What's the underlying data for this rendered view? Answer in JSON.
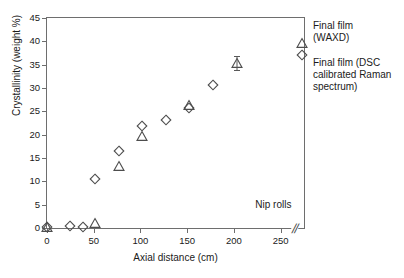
{
  "chart_data": {
    "type": "scatter",
    "title": "",
    "xlabel": "Axial distance (cm)",
    "ylabel": "Crystallinity (weight %)",
    "xlim": [
      0,
      275
    ],
    "ylim": [
      0,
      45
    ],
    "xticks": [
      0,
      50,
      100,
      150,
      200,
      250
    ],
    "yticks": [
      0,
      5,
      10,
      15,
      20,
      25,
      30,
      35,
      40,
      45
    ],
    "grid": false,
    "legend_position": "right-outside",
    "axis_break": {
      "symbol": "//",
      "x_value": 265,
      "note": "break on axial distance axis before final film point"
    },
    "series": [
      {
        "name": "Final film (DSC calibrated Raman spectrum)",
        "marker": "diamond-open",
        "color": "#4d4d4d",
        "points": [
          {
            "x": 0,
            "y": 0.2
          },
          {
            "x": 25,
            "y": 0.4
          },
          {
            "x": 38,
            "y": 0.3
          },
          {
            "x": 51,
            "y": 10.5
          },
          {
            "x": 77,
            "y": 16.5
          },
          {
            "x": 102,
            "y": 21.9
          },
          {
            "x": 127,
            "y": 23.2
          },
          {
            "x": 152,
            "y": 25.7
          },
          {
            "x": 178,
            "y": 30.7
          }
        ],
        "final_film_point": {
          "x": 273,
          "y": 37.0
        }
      },
      {
        "name": "Final film (WAXD)",
        "marker": "triangle-open",
        "color": "#4d4d4d",
        "points": [
          {
            "x": 0,
            "y": 0.2
          },
          {
            "x": 51,
            "y": 1.0
          },
          {
            "x": 77,
            "y": 13.3
          },
          {
            "x": 102,
            "y": 19.7
          },
          {
            "x": 152,
            "y": 26.3
          },
          {
            "x": 203,
            "y": 35.4,
            "yerr": 1.5
          }
        ],
        "final_film_point": {
          "x": 273,
          "y": 39.7
        }
      }
    ],
    "annotations": [
      {
        "name": "nip-rolls",
        "text": "Nip rolls",
        "x": 255,
        "y": 5.0
      },
      {
        "name": "waxd-callout",
        "text": "Final film\n(WAXD)"
      },
      {
        "name": "raman-callout",
        "text": "Final film (DSC calibrated Raman spectrum)"
      }
    ]
  },
  "labels": {
    "xaxis_title": "Axial distance (cm)",
    "yaxis_title": "Crystallinity (weight %)",
    "nip_rolls": "Nip rolls",
    "legend_waxd_line1": "Final film",
    "legend_waxd_line2": "(WAXD)",
    "legend_raman": "Final film (DSC calibrated Raman spectrum)",
    "axis_break_symbol": "//"
  },
  "ticks": {
    "y": [
      "45",
      "40",
      "35",
      "30",
      "25",
      "20",
      "15",
      "10",
      "5",
      "0"
    ],
    "x": [
      "0",
      "50",
      "100",
      "150",
      "200",
      "250"
    ]
  },
  "colors": {
    "axis": "#6e6e6e",
    "marker": "#4d4d4d",
    "text": "#1a1a1a",
    "background": "#ffffff"
  }
}
